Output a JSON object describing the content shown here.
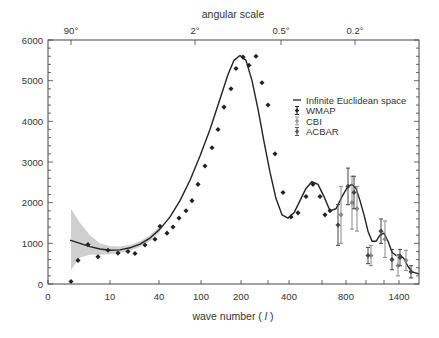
{
  "chart_data": {
    "type": "scatter",
    "title": "",
    "top_axis": {
      "label": "angular scale",
      "ticks": [
        {
          "label": "90°",
          "px": 71
        },
        {
          "label": "2°",
          "px": 195
        },
        {
          "label": "0.5°",
          "px": 281
        },
        {
          "label": "0.2°",
          "px": 355
        }
      ]
    },
    "xlabel": "wave number ( l )",
    "xlabel_parts": {
      "prefix": "wave number ( ",
      "var": "l",
      "suffix": " )"
    },
    "ylabel": "",
    "ylim": [
      0,
      6000
    ],
    "yticks": [
      0,
      1000,
      2000,
      3000,
      4000,
      5000,
      6000
    ],
    "xticks": [
      {
        "label": "0",
        "px": 48
      },
      {
        "label": "10",
        "px": 110
      },
      {
        "label": "40",
        "px": 159
      },
      {
        "label": "100",
        "px": 201
      },
      {
        "label": "200",
        "px": 241
      },
      {
        "label": "",
        "px": 268
      },
      {
        "label": "400",
        "px": 289
      },
      {
        "label": "",
        "px": 322
      },
      {
        "label": "800",
        "px": 346
      },
      {
        "label": "",
        "px": 366
      },
      {
        "label": "",
        "px": 384
      },
      {
        "label": "1400",
        "px": 399
      }
    ],
    "x_scale": "nonlinear (pixel-mapped)",
    "legend": {
      "position": "upper right",
      "entries": [
        "Infinite Euclidean space",
        "WMAP",
        "CBI",
        "ACBAR"
      ]
    },
    "grid": false,
    "series": [
      {
        "name": "Infinite Euclidean space",
        "kind": "line",
        "points_px_x": [
          48,
          70,
          80,
          90,
          100,
          110,
          120,
          130,
          140,
          150,
          160,
          170,
          180,
          190,
          200,
          210,
          220,
          228,
          234,
          240,
          246,
          252,
          258,
          264,
          270,
          276,
          282,
          288,
          294,
          300,
          306,
          312,
          318,
          324,
          330,
          336,
          342,
          348,
          352,
          356,
          360,
          364,
          368,
          372,
          376,
          380,
          384,
          388,
          392,
          396,
          400,
          404,
          408,
          412,
          419
        ],
        "values": [
          1100,
          1080,
          1000,
          920,
          860,
          830,
          840,
          890,
          980,
          1130,
          1350,
          1650,
          2050,
          2550,
          3150,
          3800,
          4550,
          5150,
          5500,
          5620,
          5500,
          5000,
          4300,
          3500,
          2750,
          2100,
          1700,
          1620,
          1750,
          2050,
          2350,
          2520,
          2450,
          2150,
          1800,
          1850,
          2150,
          2400,
          2450,
          2350,
          2050,
          1700,
          1300,
          1050,
          1050,
          1200,
          1250,
          1050,
          780,
          700,
          720,
          620,
          430,
          300,
          250
        ]
      },
      {
        "name": "WMAP",
        "kind": "points",
        "points_px_x": [
          71,
          78,
          88,
          98,
          108,
          118,
          128,
          135,
          145,
          155,
          160,
          167,
          173,
          179,
          186,
          192,
          198,
          205,
          212,
          218,
          224,
          231,
          236,
          243,
          249,
          256,
          262,
          268,
          275,
          283,
          291,
          298,
          306,
          313,
          320,
          325,
          330
        ],
        "values": [
          60,
          580,
          970,
          670,
          830,
          760,
          800,
          750,
          960,
          1100,
          1420,
          1250,
          1400,
          1620,
          1800,
          2050,
          2450,
          2900,
          3350,
          3800,
          4350,
          4800,
          5300,
          5580,
          5380,
          5600,
          4950,
          4400,
          3200,
          2250,
          1650,
          1750,
          2150,
          2450,
          2150,
          1700,
          1800
        ]
      },
      {
        "name": "CBI",
        "kind": "errorbar",
        "points_px_x": [
          341,
          352,
          357,
          371,
          385,
          398,
          406
        ],
        "values": [
          1700,
          2000,
          1850,
          700,
          1100,
          450,
          580
        ],
        "errors": [
          700,
          650,
          550,
          250,
          450,
          250,
          250
        ]
      },
      {
        "name": "ACBAR",
        "kind": "errorbar",
        "points_px_x": [
          338,
          348,
          354,
          368,
          381,
          392,
          400,
          411
        ],
        "values": [
          1450,
          2400,
          2250,
          700,
          1300,
          600,
          650,
          300
        ],
        "errors": [
          500,
          450,
          400,
          200,
          300,
          250,
          200,
          150
        ]
      }
    ],
    "cosmic_variance_band": {
      "points_px_x": [
        71,
        80,
        90,
        100,
        110,
        120,
        130,
        140,
        150,
        160
      ],
      "upper": [
        1850,
        1500,
        1200,
        1000,
        930,
        920,
        960,
        1050,
        1200,
        1420
      ],
      "lower": [
        350,
        650,
        720,
        720,
        730,
        760,
        820,
        910,
        1060,
        1280
      ]
    }
  }
}
